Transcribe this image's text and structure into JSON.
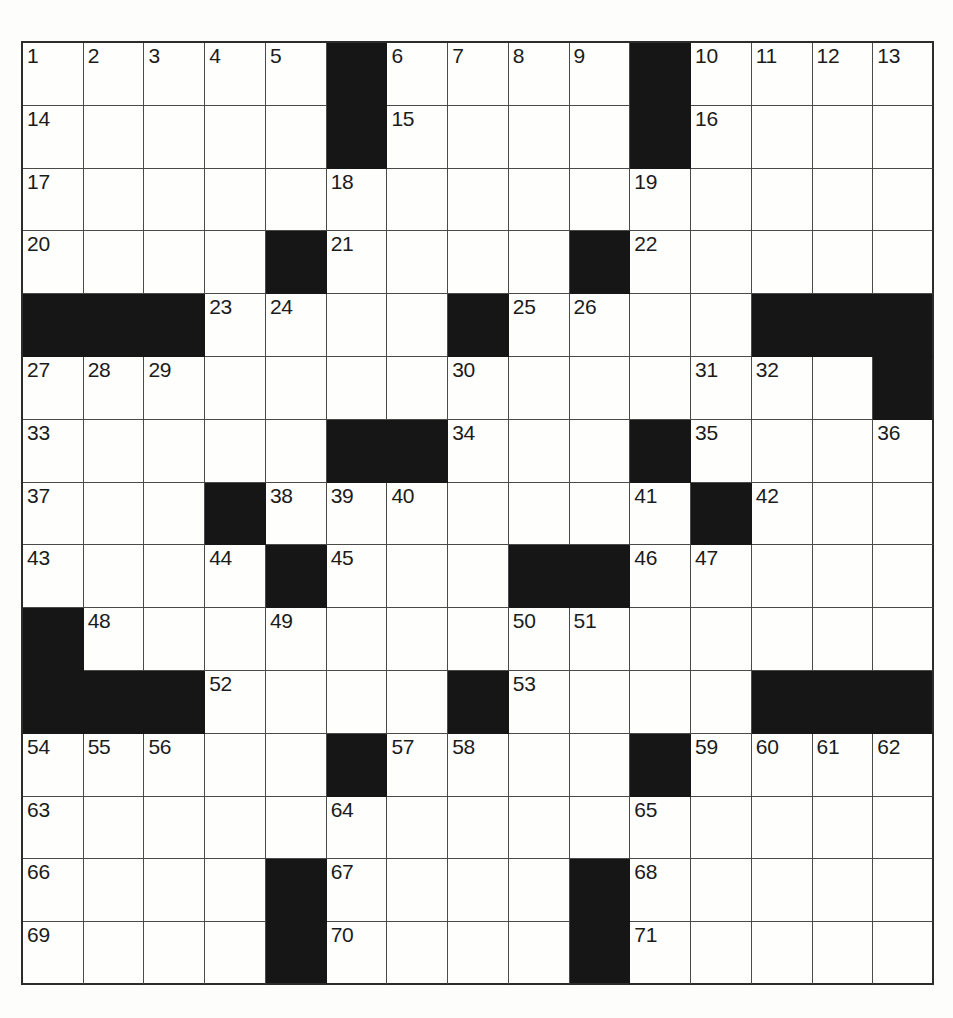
{
  "puzzle": {
    "title": "Crossword Puzzle Grid",
    "size": {
      "rows": 15,
      "cols": 15
    },
    "colors": {
      "block": "#161616",
      "cell": "#fefefd",
      "grid_line": "#4a4a4a",
      "border": "#2c2c2c",
      "number_text": "#1b1b1b",
      "page_background": "#ffffff"
    },
    "legend": {
      "block_label": "blocked-square",
      "open_label": "open-square"
    },
    "grid": [
      [
        {
          "block": false,
          "num": "1"
        },
        {
          "block": false,
          "num": "2"
        },
        {
          "block": false,
          "num": "3"
        },
        {
          "block": false,
          "num": "4"
        },
        {
          "block": false,
          "num": "5"
        },
        {
          "block": true,
          "num": ""
        },
        {
          "block": false,
          "num": "6"
        },
        {
          "block": false,
          "num": "7"
        },
        {
          "block": false,
          "num": "8"
        },
        {
          "block": false,
          "num": "9"
        },
        {
          "block": true,
          "num": ""
        },
        {
          "block": false,
          "num": "10"
        },
        {
          "block": false,
          "num": "11"
        },
        {
          "block": false,
          "num": "12"
        },
        {
          "block": false,
          "num": "13"
        }
      ],
      [
        {
          "block": false,
          "num": "14"
        },
        {
          "block": false,
          "num": ""
        },
        {
          "block": false,
          "num": ""
        },
        {
          "block": false,
          "num": ""
        },
        {
          "block": false,
          "num": ""
        },
        {
          "block": true,
          "num": ""
        },
        {
          "block": false,
          "num": "15"
        },
        {
          "block": false,
          "num": ""
        },
        {
          "block": false,
          "num": ""
        },
        {
          "block": false,
          "num": ""
        },
        {
          "block": true,
          "num": ""
        },
        {
          "block": false,
          "num": "16"
        },
        {
          "block": false,
          "num": ""
        },
        {
          "block": false,
          "num": ""
        },
        {
          "block": false,
          "num": ""
        }
      ],
      [
        {
          "block": false,
          "num": "17"
        },
        {
          "block": false,
          "num": ""
        },
        {
          "block": false,
          "num": ""
        },
        {
          "block": false,
          "num": ""
        },
        {
          "block": false,
          "num": ""
        },
        {
          "block": false,
          "num": "18"
        },
        {
          "block": false,
          "num": ""
        },
        {
          "block": false,
          "num": ""
        },
        {
          "block": false,
          "num": ""
        },
        {
          "block": false,
          "num": ""
        },
        {
          "block": false,
          "num": "19"
        },
        {
          "block": false,
          "num": ""
        },
        {
          "block": false,
          "num": ""
        },
        {
          "block": false,
          "num": ""
        },
        {
          "block": false,
          "num": ""
        }
      ],
      [
        {
          "block": false,
          "num": "20"
        },
        {
          "block": false,
          "num": ""
        },
        {
          "block": false,
          "num": ""
        },
        {
          "block": false,
          "num": ""
        },
        {
          "block": true,
          "num": ""
        },
        {
          "block": false,
          "num": "21"
        },
        {
          "block": false,
          "num": ""
        },
        {
          "block": false,
          "num": ""
        },
        {
          "block": false,
          "num": ""
        },
        {
          "block": true,
          "num": ""
        },
        {
          "block": false,
          "num": "22"
        },
        {
          "block": false,
          "num": ""
        },
        {
          "block": false,
          "num": ""
        },
        {
          "block": false,
          "num": ""
        },
        {
          "block": false,
          "num": ""
        }
      ],
      [
        {
          "block": true,
          "num": ""
        },
        {
          "block": true,
          "num": ""
        },
        {
          "block": true,
          "num": ""
        },
        {
          "block": false,
          "num": "23"
        },
        {
          "block": false,
          "num": "24"
        },
        {
          "block": false,
          "num": ""
        },
        {
          "block": false,
          "num": ""
        },
        {
          "block": true,
          "num": ""
        },
        {
          "block": false,
          "num": "25"
        },
        {
          "block": false,
          "num": "26"
        },
        {
          "block": false,
          "num": ""
        },
        {
          "block": false,
          "num": ""
        },
        {
          "block": true,
          "num": ""
        },
        {
          "block": true,
          "num": ""
        },
        {
          "block": true,
          "num": ""
        }
      ],
      [
        {
          "block": false,
          "num": "27"
        },
        {
          "block": false,
          "num": "28"
        },
        {
          "block": false,
          "num": "29"
        },
        {
          "block": false,
          "num": ""
        },
        {
          "block": false,
          "num": ""
        },
        {
          "block": false,
          "num": ""
        },
        {
          "block": false,
          "num": ""
        },
        {
          "block": false,
          "num": "30"
        },
        {
          "block": false,
          "num": ""
        },
        {
          "block": false,
          "num": ""
        },
        {
          "block": false,
          "num": ""
        },
        {
          "block": false,
          "num": "31"
        },
        {
          "block": false,
          "num": "32"
        },
        {
          "block": false,
          "num": ""
        },
        {
          "block": true,
          "num": ""
        }
      ],
      [
        {
          "block": false,
          "num": "33"
        },
        {
          "block": false,
          "num": ""
        },
        {
          "block": false,
          "num": ""
        },
        {
          "block": false,
          "num": ""
        },
        {
          "block": false,
          "num": ""
        },
        {
          "block": true,
          "num": ""
        },
        {
          "block": true,
          "num": ""
        },
        {
          "block": false,
          "num": "34"
        },
        {
          "block": false,
          "num": ""
        },
        {
          "block": false,
          "num": ""
        },
        {
          "block": true,
          "num": ""
        },
        {
          "block": false,
          "num": "35"
        },
        {
          "block": false,
          "num": ""
        },
        {
          "block": false,
          "num": ""
        },
        {
          "block": false,
          "num": "36"
        }
      ],
      [
        {
          "block": false,
          "num": "37"
        },
        {
          "block": false,
          "num": ""
        },
        {
          "block": false,
          "num": ""
        },
        {
          "block": true,
          "num": ""
        },
        {
          "block": false,
          "num": "38"
        },
        {
          "block": false,
          "num": "39"
        },
        {
          "block": false,
          "num": "40"
        },
        {
          "block": false,
          "num": ""
        },
        {
          "block": false,
          "num": ""
        },
        {
          "block": false,
          "num": ""
        },
        {
          "block": false,
          "num": "41"
        },
        {
          "block": true,
          "num": ""
        },
        {
          "block": false,
          "num": "42"
        },
        {
          "block": false,
          "num": ""
        },
        {
          "block": false,
          "num": ""
        }
      ],
      [
        {
          "block": false,
          "num": "43"
        },
        {
          "block": false,
          "num": ""
        },
        {
          "block": false,
          "num": ""
        },
        {
          "block": false,
          "num": "44"
        },
        {
          "block": true,
          "num": ""
        },
        {
          "block": false,
          "num": "45"
        },
        {
          "block": false,
          "num": ""
        },
        {
          "block": false,
          "num": ""
        },
        {
          "block": true,
          "num": ""
        },
        {
          "block": true,
          "num": ""
        },
        {
          "block": false,
          "num": "46"
        },
        {
          "block": false,
          "num": "47"
        },
        {
          "block": false,
          "num": ""
        },
        {
          "block": false,
          "num": ""
        },
        {
          "block": false,
          "num": ""
        }
      ],
      [
        {
          "block": true,
          "num": ""
        },
        {
          "block": false,
          "num": "48"
        },
        {
          "block": false,
          "num": ""
        },
        {
          "block": false,
          "num": ""
        },
        {
          "block": false,
          "num": "49"
        },
        {
          "block": false,
          "num": ""
        },
        {
          "block": false,
          "num": ""
        },
        {
          "block": false,
          "num": ""
        },
        {
          "block": false,
          "num": "50"
        },
        {
          "block": false,
          "num": "51"
        },
        {
          "block": false,
          "num": ""
        },
        {
          "block": false,
          "num": ""
        },
        {
          "block": false,
          "num": ""
        },
        {
          "block": false,
          "num": ""
        },
        {
          "block": false,
          "num": ""
        }
      ],
      [
        {
          "block": true,
          "num": ""
        },
        {
          "block": true,
          "num": ""
        },
        {
          "block": true,
          "num": ""
        },
        {
          "block": false,
          "num": "52"
        },
        {
          "block": false,
          "num": ""
        },
        {
          "block": false,
          "num": ""
        },
        {
          "block": false,
          "num": ""
        },
        {
          "block": true,
          "num": ""
        },
        {
          "block": false,
          "num": "53"
        },
        {
          "block": false,
          "num": ""
        },
        {
          "block": false,
          "num": ""
        },
        {
          "block": false,
          "num": ""
        },
        {
          "block": true,
          "num": ""
        },
        {
          "block": true,
          "num": ""
        },
        {
          "block": true,
          "num": ""
        }
      ],
      [
        {
          "block": false,
          "num": "54"
        },
        {
          "block": false,
          "num": "55"
        },
        {
          "block": false,
          "num": "56"
        },
        {
          "block": false,
          "num": ""
        },
        {
          "block": false,
          "num": ""
        },
        {
          "block": true,
          "num": ""
        },
        {
          "block": false,
          "num": "57"
        },
        {
          "block": false,
          "num": "58"
        },
        {
          "block": false,
          "num": ""
        },
        {
          "block": false,
          "num": ""
        },
        {
          "block": true,
          "num": ""
        },
        {
          "block": false,
          "num": "59"
        },
        {
          "block": false,
          "num": "60"
        },
        {
          "block": false,
          "num": "61"
        },
        {
          "block": false,
          "num": "62"
        }
      ],
      [
        {
          "block": false,
          "num": "63"
        },
        {
          "block": false,
          "num": ""
        },
        {
          "block": false,
          "num": ""
        },
        {
          "block": false,
          "num": ""
        },
        {
          "block": false,
          "num": ""
        },
        {
          "block": false,
          "num": "64"
        },
        {
          "block": false,
          "num": ""
        },
        {
          "block": false,
          "num": ""
        },
        {
          "block": false,
          "num": ""
        },
        {
          "block": false,
          "num": ""
        },
        {
          "block": false,
          "num": "65"
        },
        {
          "block": false,
          "num": ""
        },
        {
          "block": false,
          "num": ""
        },
        {
          "block": false,
          "num": ""
        },
        {
          "block": false,
          "num": ""
        }
      ],
      [
        {
          "block": false,
          "num": "66"
        },
        {
          "block": false,
          "num": ""
        },
        {
          "block": false,
          "num": ""
        },
        {
          "block": false,
          "num": ""
        },
        {
          "block": true,
          "num": ""
        },
        {
          "block": false,
          "num": "67"
        },
        {
          "block": false,
          "num": ""
        },
        {
          "block": false,
          "num": ""
        },
        {
          "block": false,
          "num": ""
        },
        {
          "block": true,
          "num": ""
        },
        {
          "block": false,
          "num": "68"
        },
        {
          "block": false,
          "num": ""
        },
        {
          "block": false,
          "num": ""
        },
        {
          "block": false,
          "num": ""
        },
        {
          "block": false,
          "num": ""
        }
      ],
      [
        {
          "block": false,
          "num": "69"
        },
        {
          "block": false,
          "num": ""
        },
        {
          "block": false,
          "num": ""
        },
        {
          "block": false,
          "num": ""
        },
        {
          "block": true,
          "num": ""
        },
        {
          "block": false,
          "num": "70"
        },
        {
          "block": false,
          "num": ""
        },
        {
          "block": false,
          "num": ""
        },
        {
          "block": false,
          "num": ""
        },
        {
          "block": true,
          "num": ""
        },
        {
          "block": false,
          "num": "71"
        },
        {
          "block": false,
          "num": ""
        },
        {
          "block": false,
          "num": ""
        },
        {
          "block": false,
          "num": ""
        },
        {
          "block": false,
          "num": ""
        }
      ]
    ]
  }
}
